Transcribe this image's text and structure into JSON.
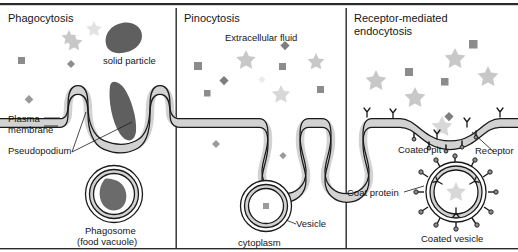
{
  "figure": {
    "title_top_rule": "",
    "panels": [
      {
        "id": "phagocytosis",
        "title": "Phagocytosis",
        "labels": [
          {
            "name": "solid-particle-label",
            "text": "solid particle"
          },
          {
            "name": "plasma-membrane-label",
            "text": "Plasma\nmembrane"
          },
          {
            "name": "pseudopodium-label",
            "text": "Pseudopodium"
          },
          {
            "name": "phagosome-label",
            "text": "Phagosome"
          },
          {
            "name": "food-vacuole-label",
            "text": "(food vacuole)"
          }
        ]
      },
      {
        "id": "pinocytosis",
        "title": "Pinocytosis",
        "labels": [
          {
            "name": "extracellular-fluid-label",
            "text": "Extracellular fluid"
          },
          {
            "name": "vesicle-label",
            "text": "Vesicle"
          },
          {
            "name": "cytoplasm-label",
            "text": "cytoplasm"
          }
        ]
      },
      {
        "id": "receptor-mediated-endocytosis",
        "title": "Receptor-mediated\nendocytosis",
        "labels": [
          {
            "name": "coated-pit-label",
            "text": "Coated pit"
          },
          {
            "name": "receptor-label",
            "text": "Receptor"
          },
          {
            "name": "coat-protein-label",
            "text": "Coat protein"
          },
          {
            "name": "coated-vesicle-label",
            "text": "Coated vesicle"
          }
        ]
      }
    ],
    "colors": {
      "outline": "#1a1a1a",
      "membrane_fill": "#d2d2d2",
      "particle_dark": "#595959",
      "particle_mid": "#8c8c8c",
      "particle_light": "#c8c8c8",
      "particle_faint": "#e2e2e2",
      "background": "#ffffff",
      "divider": "#2b2b2b"
    }
  }
}
